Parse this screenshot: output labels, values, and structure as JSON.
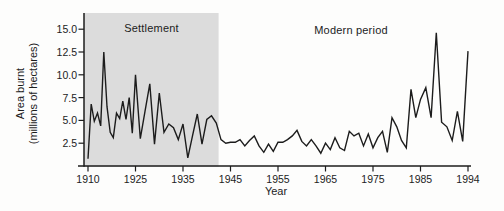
{
  "figure": {
    "region_labels": {
      "settlement": "Settlement",
      "modern": "Modern period"
    },
    "y_axis": {
      "title_line1": "Area burnt",
      "title_line2": "(millions of hectares)",
      "tick_labels": [
        "15.0",
        "12.5",
        "10.0",
        "7.5",
        "5.0",
        "2.5"
      ]
    },
    "x_axis": {
      "title": "Year",
      "tick_labels": [
        "1910",
        "1925",
        "1935",
        "1945",
        "1955",
        "1965",
        "1975",
        "1985",
        "1994"
      ]
    }
  },
  "chart_data": {
    "type": "line",
    "title": "",
    "xlabel": "Year",
    "ylabel": "Area burnt (millions of hectares)",
    "years_range": [
      1910,
      1994
    ],
    "values": [
      0.8,
      6.8,
      4.9,
      5.8,
      4.4,
      12.5,
      6.5,
      3.7,
      3.1,
      5.8,
      5.2,
      7.1,
      5.1,
      7.5,
      3.6,
      10.0,
      3.0,
      6.0,
      9.0,
      2.4,
      8.0,
      3.7,
      4.6,
      4.2,
      2.9,
      4.6,
      0.9,
      3.3,
      5.7,
      2.4,
      5.1,
      5.5,
      4.7,
      2.9,
      2.5,
      2.6,
      2.6,
      2.9,
      2.2,
      2.8,
      3.3,
      2.2,
      1.5,
      2.4,
      1.6,
      2.6,
      2.6,
      2.9,
      3.3,
      3.9,
      2.7,
      2.2,
      2.9,
      2.2,
      1.4,
      2.5,
      1.8,
      3.1,
      2.0,
      1.7,
      3.8,
      3.3,
      3.6,
      2.2,
      3.5,
      2.0,
      3.1,
      3.8,
      1.5,
      5.3,
      4.3,
      2.8,
      2.0,
      8.4,
      5.3,
      7.3,
      8.6,
      5.3,
      14.6,
      4.8,
      4.3,
      2.8,
      6.0,
      2.7,
      12.6
    ],
    "x_tick_years": [
      1910,
      1925,
      1935,
      1945,
      1955,
      1965,
      1975,
      1985,
      1994
    ],
    "y_ticks": [
      15,
      12.5,
      10,
      7.5,
      5,
      2.5
    ],
    "ylim": [
      0,
      16
    ],
    "grid": false,
    "legend": "none",
    "annotations": [
      {
        "label": "Settlement",
        "type": "shaded-period",
        "from_year": 1910,
        "to_year": 1942.5
      },
      {
        "label": "Modern period",
        "type": "text"
      }
    ],
    "shaded_region": {
      "from_year": 1910,
      "to_year": 1942.5,
      "color": "#dcdcdc"
    },
    "line_color": "#1c1c1c"
  }
}
